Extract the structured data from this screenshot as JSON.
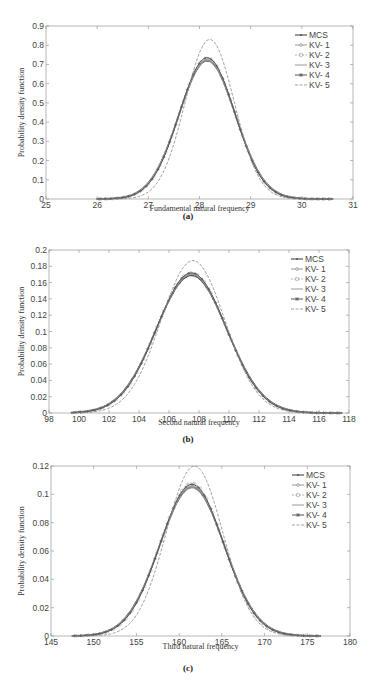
{
  "chart_data": [
    {
      "type": "line",
      "id": "a",
      "caption": "(a)",
      "title": "",
      "xlabel": "Fundamental natural frequency",
      "ylabel": "Probability density function",
      "xlim": [
        25,
        31
      ],
      "ylim": [
        0,
        0.9
      ],
      "xticks": [
        "25",
        "26",
        "27",
        "28",
        "29",
        "30",
        "31"
      ],
      "yticks": [
        "0",
        "0.1",
        "0.2",
        "0.3",
        "0.4",
        "0.5",
        "0.6",
        "0.7",
        "0.8",
        "0.9"
      ],
      "grid": false,
      "legend_position": "upper right",
      "legend": [
        "MCS",
        "KV- 1",
        "KV- 2",
        "KV- 3",
        "KV- 4",
        "KV- 5"
      ],
      "series": [
        {
          "name": "MCS",
          "mean": 28.15,
          "peak": 0.72,
          "x_range": [
            26.0,
            30.6
          ]
        },
        {
          "name": "KV- 1",
          "mean": 28.15,
          "peak": 0.725,
          "x_range": [
            26.0,
            30.6
          ]
        },
        {
          "name": "KV- 2",
          "mean": 28.15,
          "peak": 0.73,
          "x_range": [
            26.0,
            30.6
          ]
        },
        {
          "name": "KV- 3",
          "mean": 28.15,
          "peak": 0.72,
          "x_range": [
            26.0,
            30.6
          ]
        },
        {
          "name": "KV- 4",
          "mean": 28.15,
          "peak": 0.735,
          "x_range": [
            26.0,
            30.6
          ]
        },
        {
          "name": "KV- 5",
          "mean": 28.2,
          "peak": 0.83,
          "x_range": [
            26.0,
            30.6
          ]
        }
      ]
    },
    {
      "type": "line",
      "id": "b",
      "caption": "(b)",
      "title": "",
      "xlabel": "Second natural frequency",
      "ylabel": "Probability density function",
      "xlim": [
        98,
        118
      ],
      "ylim": [
        0,
        0.2
      ],
      "xticks": [
        "98",
        "100",
        "102",
        "104",
        "106",
        "108",
        "110",
        "112",
        "114",
        "116",
        "118"
      ],
      "yticks": [
        "0",
        "0.02",
        "0.04",
        "0.06",
        "0.08",
        "0.1",
        "0.12",
        "0.14",
        "0.16",
        "0.18",
        "0.2"
      ],
      "grid": false,
      "legend_position": "upper right",
      "legend": [
        "MCS",
        "KV- 1",
        "KV- 2",
        "KV- 3",
        "KV- 4",
        "KV- 5"
      ],
      "series": [
        {
          "name": "MCS",
          "mean": 107.5,
          "peak": 0.169,
          "x_range": [
            99.5,
            117.5
          ]
        },
        {
          "name": "KV- 1",
          "mean": 107.5,
          "peak": 0.171,
          "x_range": [
            99.5,
            117.5
          ]
        },
        {
          "name": "KV- 2",
          "mean": 107.5,
          "peak": 0.172,
          "x_range": [
            99.5,
            117.5
          ]
        },
        {
          "name": "KV- 3",
          "mean": 107.5,
          "peak": 0.17,
          "x_range": [
            99.5,
            117.5
          ]
        },
        {
          "name": "KV- 4",
          "mean": 107.5,
          "peak": 0.172,
          "x_range": [
            99.5,
            117.5
          ]
        },
        {
          "name": "KV- 5",
          "mean": 107.6,
          "peak": 0.187,
          "x_range": [
            99.5,
            117.5
          ]
        }
      ]
    },
    {
      "type": "line",
      "id": "c",
      "caption": "(c)",
      "title": "",
      "xlabel": "Third natural frequency",
      "ylabel": "Probability density function",
      "xlim": [
        145,
        180
      ],
      "ylim": [
        0,
        0.12
      ],
      "xticks": [
        "145",
        "150",
        "155",
        "160",
        "165",
        "170",
        "175",
        "180"
      ],
      "yticks": [
        "0",
        "0.02",
        "0.04",
        "0.06",
        "0.08",
        "0.1",
        "0.12"
      ],
      "grid": false,
      "legend_position": "upper right",
      "legend": [
        "MCS",
        "KV- 1",
        "KV- 2",
        "KV- 3",
        "KV- 4",
        "KV- 5"
      ],
      "series": [
        {
          "name": "MCS",
          "mean": 161.5,
          "peak": 0.105,
          "x_range": [
            147.5,
            176.5
          ]
        },
        {
          "name": "KV- 1",
          "mean": 161.5,
          "peak": 0.106,
          "x_range": [
            147.5,
            176.5
          ]
        },
        {
          "name": "KV- 2",
          "mean": 161.5,
          "peak": 0.108,
          "x_range": [
            147.5,
            176.5
          ]
        },
        {
          "name": "KV- 3",
          "mean": 161.5,
          "peak": 0.105,
          "x_range": [
            147.5,
            176.5
          ]
        },
        {
          "name": "KV- 4",
          "mean": 161.5,
          "peak": 0.107,
          "x_range": [
            147.5,
            176.5
          ]
        },
        {
          "name": "KV- 5",
          "mean": 161.8,
          "peak": 0.12,
          "x_range": [
            147.5,
            176.5
          ]
        }
      ]
    }
  ],
  "colors": {
    "axis": "#999999",
    "curve_main": "#555555",
    "curve_light": "#9a9a9a",
    "curve_kv5": "#888888"
  }
}
